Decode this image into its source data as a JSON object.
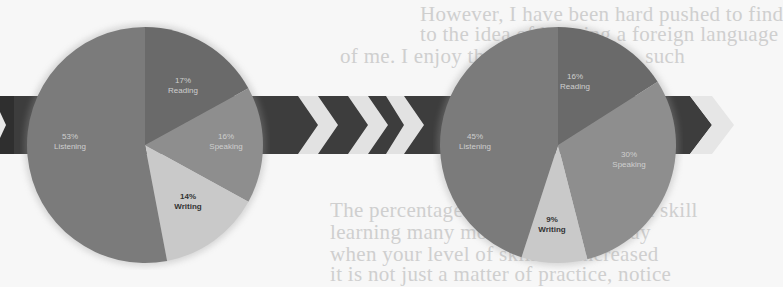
{
  "background_text": [
    {
      "text": "However, I have been hard pushed to find",
      "x": 420,
      "y": 2
    },
    {
      "text": "to the idea of learning a foreign language",
      "x": 420,
      "y": 22
    },
    {
      "text": "of me. I enjoy these simple things, such",
      "x": 340,
      "y": 44
    },
    {
      "text": "The percentage of time spent on each skill",
      "x": 330,
      "y": 198
    },
    {
      "text": "learning many more hours of the day",
      "x": 330,
      "y": 220
    },
    {
      "text": "when your level of skill has increased",
      "x": 330,
      "y": 242
    },
    {
      "text": "it is not just a matter of practice, notice",
      "x": 330,
      "y": 262
    }
  ],
  "colors": {
    "listening": "#7b7b7b",
    "reading": "#6a6a6a",
    "speaking": "#8e8e8e",
    "writing": "#c9c9c9",
    "band": "#3d3d3d",
    "chevron_light": "#e2e2e2"
  },
  "chart_data": [
    {
      "type": "pie",
      "title": "",
      "categories": [
        "Listening",
        "Reading",
        "Speaking",
        "Writing"
      ],
      "values": [
        53,
        17,
        16,
        14
      ],
      "labels": [
        "53%\nListening",
        "17%\nReading",
        "16%\nSpeaking",
        "14%\nWriting"
      ],
      "legend": "none (inline labels)"
    },
    {
      "type": "pie",
      "title": "",
      "categories": [
        "Listening",
        "Reading",
        "Speaking",
        "Writing"
      ],
      "values": [
        45,
        16,
        30,
        9
      ],
      "labels": [
        "45%\nListening",
        "16%\nReading",
        "30%\nSpeaking",
        "9%\nWriting"
      ],
      "legend": "none (inline labels)"
    }
  ],
  "pie1": {
    "listening": {
      "pct": "53%",
      "name": "Listening"
    },
    "reading": {
      "pct": "17%",
      "name": "Reading"
    },
    "speaking": {
      "pct": "16%",
      "name": "Speaking"
    },
    "writing": {
      "pct": "14%",
      "name": "Writing"
    }
  },
  "pie2": {
    "listening": {
      "pct": "45%",
      "name": "Listening"
    },
    "reading": {
      "pct": "16%",
      "name": "Reading"
    },
    "speaking": {
      "pct": "30%",
      "name": "Speaking"
    },
    "writing": {
      "pct": "9%",
      "name": "Writing"
    }
  }
}
